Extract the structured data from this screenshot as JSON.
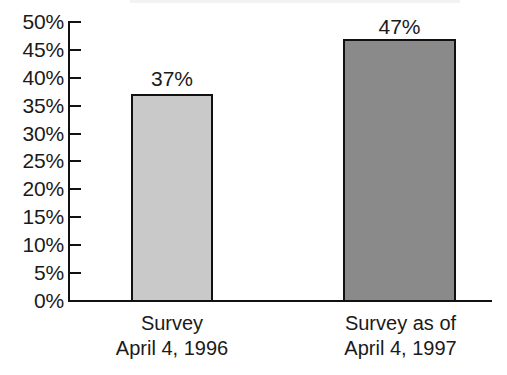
{
  "chart_data": {
    "type": "bar",
    "title": "",
    "subtitle": "",
    "xlabel": "",
    "ylabel": "",
    "categories": [
      "Survey April 4, 1996",
      "Survey as of April 4, 1997"
    ],
    "category_lines": [
      [
        "Survey",
        "April 4, 1996"
      ],
      [
        "Survey as of",
        "April 4, 1997"
      ]
    ],
    "values": [
      37,
      47
    ],
    "value_labels": [
      "37%",
      "47%"
    ],
    "bar_colors": [
      "#c9c9c9",
      "#8a8a8a"
    ],
    "bar_border_color": "#111111",
    "ylim": [
      0,
      50
    ],
    "ytick_values": [
      50,
      45,
      40,
      35,
      30,
      25,
      20,
      15,
      10,
      5,
      0
    ],
    "ytick_labels": [
      "50%",
      "45%",
      "40%",
      "35%",
      "30%",
      "25%",
      "20%",
      "15%",
      "10%",
      "5%",
      "0%"
    ],
    "grid": false,
    "legend": false,
    "axis_color": "#111111",
    "background_color": "#ffffff"
  }
}
